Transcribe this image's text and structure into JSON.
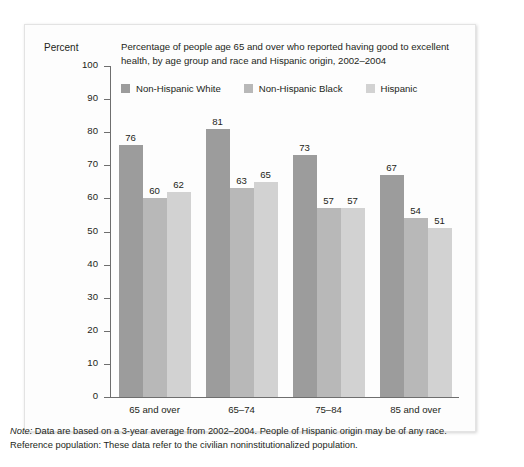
{
  "chart_data": {
    "type": "bar",
    "title": "Percentage of people age 65 and over who reported having good to excellent health, by age group and race and Hispanic origin, 2002–2004",
    "title_line1": "Percentage of people age 65 and over who reported having good to excellent",
    "title_line2": "health, by age group and race and Hispanic origin, 2002–2004",
    "ylabel": "Percent",
    "xlabel": "",
    "ylim": [
      0,
      100
    ],
    "ytick_step": 10,
    "yticks": [
      100,
      90,
      80,
      70,
      60,
      50,
      40,
      30,
      20,
      10,
      0
    ],
    "grid": false,
    "legend_position": "top-left",
    "categories": [
      "65 and over",
      "65–74",
      "75–84",
      "85 and over"
    ],
    "series": [
      {
        "name": "Non-Hispanic White",
        "color": "#9c9c9c",
        "values": [
          76,
          81,
          73,
          67
        ]
      },
      {
        "name": "Non-Hispanic Black",
        "color": "#b8b8b8",
        "values": [
          60,
          63,
          57,
          54
        ]
      },
      {
        "name": "Hispanic",
        "color": "#d2d2d2",
        "values": [
          62,
          65,
          57,
          51
        ]
      }
    ]
  },
  "footnote": {
    "note_label": "Note:",
    "note_text": " Data are based on a 3-year average from 2002–2004. People of Hispanic origin may be of any race.",
    "reference_text": "Reference population: These data refer to the civilian noninstitutionalized population."
  }
}
